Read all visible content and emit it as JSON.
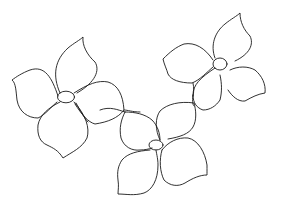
{
  "image": {
    "description": "Hand-drawn black line art of three four-petal flowers connected by a wavy vine on white background",
    "background": "#ffffff",
    "stroke_color": "#1a1a1a",
    "flowers": [
      {
        "name": "left-flower",
        "center": [
          65,
          97
        ],
        "petals": 4
      },
      {
        "name": "right-flower",
        "center": [
          221,
          63
        ],
        "petals": 4
      },
      {
        "name": "bottom-flower",
        "center": [
          157,
          145
        ],
        "petals": 4
      }
    ]
  }
}
